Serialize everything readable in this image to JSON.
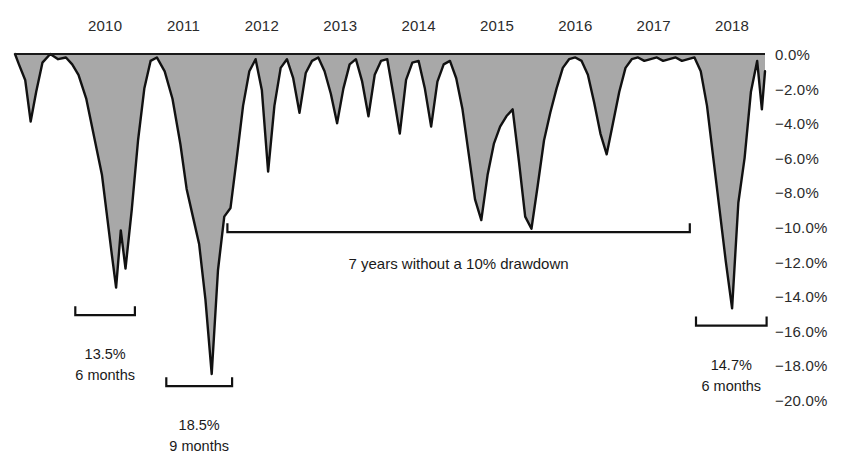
{
  "chart_data": {
    "type": "area",
    "title": "",
    "subtitle": "",
    "xlabel": "",
    "ylabel": "",
    "ylim": [
      -20.0,
      0.0
    ],
    "xlim": [
      2009.35,
      2018.92
    ],
    "grid": false,
    "legend": null,
    "series_name": "Drawdown from prior peak",
    "fill_color": "#a8a8a8",
    "line_color": "#111111",
    "axis_color": "#1a1a1a",
    "y_ticks": [
      "0.0%",
      "-2.0%",
      "-4.0%",
      "-6.0%",
      "-8.0%",
      "-10.0%",
      "-12.0%",
      "-14.0%",
      "-16.0%",
      "-18.0%",
      "-20.0%"
    ],
    "y_tick_values": [
      0.0,
      -2.0,
      -4.0,
      -6.0,
      -8.0,
      -10.0,
      -12.0,
      -14.0,
      -16.0,
      -18.0,
      -20.0
    ],
    "x_ticks": [
      "2010",
      "2011",
      "2012",
      "2013",
      "2014",
      "2015",
      "2016",
      "2017",
      "2018"
    ],
    "x_tick_values": [
      2010,
      2011,
      2012,
      2013,
      2014,
      2015,
      2016,
      2017,
      2018
    ],
    "x": [
      2009.35,
      2009.4,
      2009.48,
      2009.55,
      2009.62,
      2009.7,
      2009.8,
      2009.9,
      2010.0,
      2010.08,
      2010.16,
      2010.26,
      2010.36,
      2010.46,
      2010.52,
      2010.58,
      2010.64,
      2010.7,
      2010.76,
      2010.84,
      2010.92,
      2011.0,
      2011.08,
      2011.16,
      2011.26,
      2011.36,
      2011.46,
      2011.54,
      2011.62,
      2011.7,
      2011.78,
      2011.86,
      2011.94,
      2012.02,
      2012.1,
      2012.18,
      2012.26,
      2012.34,
      2012.42,
      2012.5,
      2012.58,
      2012.66,
      2012.74,
      2012.82,
      2012.9,
      2012.98,
      2013.06,
      2013.14,
      2013.22,
      2013.3,
      2013.38,
      2013.46,
      2013.54,
      2013.62,
      2013.7,
      2013.78,
      2013.86,
      2013.94,
      2014.02,
      2014.1,
      2014.18,
      2014.26,
      2014.34,
      2014.42,
      2014.5,
      2014.58,
      2014.66,
      2014.74,
      2014.82,
      2014.9,
      2014.98,
      2015.06,
      2015.14,
      2015.22,
      2015.3,
      2015.38,
      2015.46,
      2015.54,
      2015.62,
      2015.7,
      2015.78,
      2015.86,
      2015.94,
      2016.02,
      2016.1,
      2016.18,
      2016.26,
      2016.34,
      2016.42,
      2016.5,
      2016.58,
      2016.66,
      2016.74,
      2016.82,
      2016.9,
      2016.98,
      2017.06,
      2017.14,
      2017.22,
      2017.3,
      2017.38,
      2017.46,
      2017.54,
      2017.62,
      2017.7,
      2017.78,
      2017.86,
      2017.94,
      2018.02,
      2018.1,
      2018.18,
      2018.26,
      2018.34,
      2018.42,
      2018.5,
      2018.58,
      2018.66,
      2018.74,
      2018.82,
      2018.88,
      2018.92
    ],
    "values": [
      0.0,
      -0.6,
      -1.5,
      -3.9,
      -2.2,
      -0.5,
      0.0,
      -0.3,
      -0.2,
      -0.6,
      -1.2,
      -2.6,
      -4.8,
      -7.0,
      -9.2,
      -11.4,
      -13.5,
      -10.2,
      -12.4,
      -9.0,
      -5.0,
      -2.0,
      -0.4,
      -0.2,
      -1.0,
      -2.6,
      -5.2,
      -7.8,
      -9.4,
      -11.0,
      -14.2,
      -18.5,
      -12.5,
      -9.4,
      -8.9,
      -6.0,
      -3.0,
      -1.0,
      -0.3,
      -2.1,
      -6.8,
      -3.0,
      -0.8,
      -0.3,
      -1.4,
      -3.4,
      -1.1,
      -0.4,
      -0.2,
      -1.0,
      -2.3,
      -4.0,
      -2.0,
      -0.6,
      -0.3,
      -1.6,
      -3.6,
      -1.2,
      -0.4,
      -0.3,
      -2.4,
      -4.6,
      -1.5,
      -0.5,
      -0.4,
      -2.0,
      -4.2,
      -1.6,
      -0.6,
      -0.4,
      -1.4,
      -3.2,
      -5.8,
      -8.4,
      -9.6,
      -7.0,
      -5.2,
      -4.2,
      -3.6,
      -3.2,
      -6.2,
      -9.4,
      -10.1,
      -7.6,
      -5.0,
      -3.4,
      -2.0,
      -0.8,
      -0.3,
      -0.2,
      -0.4,
      -1.2,
      -2.8,
      -4.6,
      -5.8,
      -4.0,
      -2.2,
      -0.8,
      -0.3,
      -0.2,
      -0.4,
      -0.3,
      -0.2,
      -0.4,
      -0.3,
      -0.2,
      -0.4,
      -0.3,
      -0.2,
      -1.0,
      -3.0,
      -6.0,
      -9.0,
      -12.0,
      -14.7,
      -8.6,
      -6.0,
      -2.2,
      -0.4,
      -3.2,
      -1.0
    ],
    "annotations": [
      {
        "id": "drawdown-2010",
        "kind": "bracket-below",
        "label_line1": "13.5%",
        "label_line2": "6 months",
        "x_start": 2010.12,
        "x_end": 2010.88,
        "bracket_y_value": -15.1,
        "label_y_value": -16.9
      },
      {
        "id": "drawdown-2011",
        "kind": "bracket-below",
        "label_line1": "18.5%",
        "label_line2": "9 months",
        "x_start": 2011.28,
        "x_end": 2012.12,
        "bracket_y_value": -19.2,
        "label_y_value": -21.0
      },
      {
        "id": "no-10pct-drawdown-span",
        "kind": "bracket-below-wide",
        "label_line1": "7 years without a 10% drawdown",
        "label_line2": "",
        "x_start": 2012.06,
        "x_end": 2017.96,
        "bracket_y_value": -10.3,
        "label_y_value": -11.6
      },
      {
        "id": "drawdown-2018",
        "kind": "bracket-below",
        "label_line1": "14.7%",
        "label_line2": "6 months",
        "x_start": 2018.04,
        "x_end": 2018.94,
        "bracket_y_value": -15.7,
        "label_y_value": -17.5
      }
    ]
  },
  "axis": {
    "x_axis_name": "year-axis",
    "y_axis_name": "drawdown-percent-axis"
  }
}
